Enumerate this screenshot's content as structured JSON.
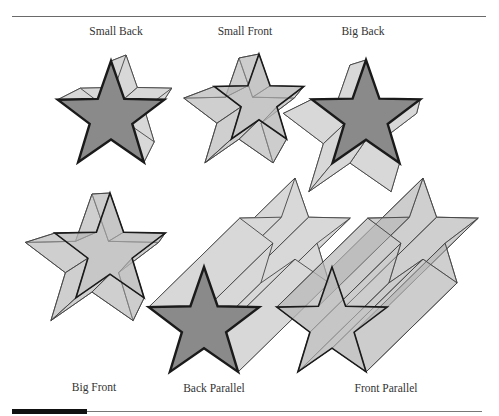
{
  "figure": {
    "colors": {
      "front_dark": "#8a8a8a",
      "side_light": "#d8d8d8",
      "translucent": "#b8b8b8",
      "outline_heavy": "#1a1a1a",
      "outline_light": "#444444",
      "rule": "#6a6a6a",
      "bar": "#111111"
    },
    "panels": [
      {
        "id": "small-back",
        "label": "Small Back",
        "label_pos": [
          116,
          26
        ],
        "mode": "opaque",
        "front": {
          "cx": 111,
          "cy": 117,
          "r": 56,
          "rot": 0
        },
        "back": {
          "cx": 126,
          "cy": 103,
          "r": 48,
          "rot": 0
        }
      },
      {
        "id": "small-front",
        "label": "Small Front",
        "label_pos": [
          245,
          26
        ],
        "mode": "translucent",
        "front": {
          "cx": 259,
          "cy": 101,
          "r": 47,
          "rot": 0
        },
        "back": {
          "cx": 239,
          "cy": 116,
          "r": 58,
          "rot": 0
        }
      },
      {
        "id": "big-back",
        "label": "Big Back",
        "label_pos": [
          363,
          26
        ],
        "mode": "opaque",
        "front": {
          "cx": 366,
          "cy": 117,
          "r": 57,
          "rot": 0
        },
        "back": {
          "cx": 350,
          "cy": 135,
          "r": 70,
          "rot": 0
        }
      },
      {
        "id": "big-front",
        "label": "Big Front",
        "label_pos": [
          94,
          382
        ],
        "mode": "translucent",
        "front": {
          "cx": 110,
          "cy": 251,
          "r": 58,
          "rot": 0
        },
        "back": {
          "cx": 92,
          "cy": 264,
          "r": 70,
          "rot": 0
        }
      },
      {
        "id": "back-parallel",
        "label": "Back Parallel",
        "label_pos": [
          214,
          383
        ],
        "mode": "parallel-opaque",
        "front": {
          "cx": 204,
          "cy": 325,
          "r": 58,
          "rot": 0
        },
        "back": {
          "cx": 295,
          "cy": 236,
          "r": 58,
          "rot": 0
        }
      },
      {
        "id": "front-parallel",
        "label": "Front Parallel",
        "label_pos": [
          386,
          383
        ],
        "mode": "parallel-translucent",
        "front": {
          "cx": 332,
          "cy": 325,
          "r": 58,
          "rot": 0
        },
        "back": {
          "cx": 423,
          "cy": 236,
          "r": 58,
          "rot": 0
        }
      }
    ]
  }
}
